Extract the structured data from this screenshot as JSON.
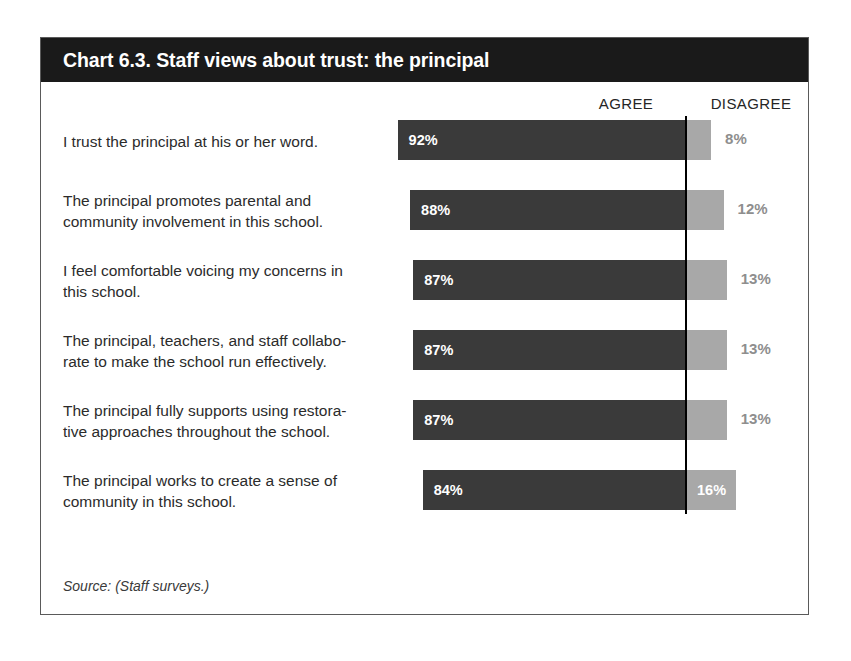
{
  "chart": {
    "title": "Chart 6.3. Staff views about trust: the principal",
    "source_note": "Source: (Staff surveys.)",
    "headers": {
      "agree": "AGREE",
      "disagree": "DISAGREE"
    }
  },
  "chart_data": {
    "type": "bar",
    "subtype": "stacked-horizontal-100",
    "title": "Chart 6.3. Staff views about trust: the principal",
    "xlabel": "",
    "ylabel": "",
    "xlim": [
      0,
      100
    ],
    "grid": false,
    "legend_position": "top-right",
    "categories": [
      "I trust the principal at his or her word.",
      "The principal promotes parental and community involvement in this school.",
      "I feel comfortable voicing my concerns in this school.",
      "The principal, teachers, and staff collaborate to make the school run effectively.",
      "The principal fully supports using restorative approaches throughout the school.",
      "The principal works to create a sense of community in this school."
    ],
    "series": [
      {
        "name": "AGREE",
        "color": "#3a3a3a",
        "values": [
          92,
          88,
          87,
          87,
          87,
          84
        ]
      },
      {
        "name": "DISAGREE",
        "color": "#a8a8a8",
        "values": [
          8,
          12,
          13,
          13,
          13,
          16
        ]
      }
    ],
    "value_labels": {
      "agree": [
        "92%",
        "88%",
        "87%",
        "87%",
        "87%",
        "84%"
      ],
      "disagree": [
        "8%",
        "12%",
        "13%",
        "13%",
        "13%",
        "16%"
      ]
    },
    "source": "Source: (Staff surveys.)"
  },
  "rows": [
    {
      "label_lines": [
        "I trust the principal at his or her word."
      ],
      "agree": 92,
      "disagree": 8,
      "agree_label": "92%",
      "disagree_label": "8%",
      "disagree_inside": false
    },
    {
      "label_lines": [
        "The principal promotes parental and",
        "community involvement in this school."
      ],
      "agree": 88,
      "disagree": 12,
      "agree_label": "88%",
      "disagree_label": "12%",
      "disagree_inside": false
    },
    {
      "label_lines": [
        "I feel comfortable voicing my concerns in",
        "this school."
      ],
      "agree": 87,
      "disagree": 13,
      "agree_label": "87%",
      "disagree_label": "13%",
      "disagree_inside": false
    },
    {
      "label_lines": [
        "The principal, teachers, and staff collabo-",
        "rate to make the school run effectively."
      ],
      "agree": 87,
      "disagree": 13,
      "agree_label": "87%",
      "disagree_label": "13%",
      "disagree_inside": false
    },
    {
      "label_lines": [
        "The principal fully supports using restora-",
        "tive approaches throughout the school."
      ],
      "agree": 87,
      "disagree": 13,
      "agree_label": "87%",
      "disagree_label": "13%",
      "disagree_inside": false
    },
    {
      "label_lines": [
        "The principal works to create a sense of",
        "community in this school."
      ],
      "agree": 84,
      "disagree": 16,
      "agree_label": "84%",
      "disagree_label": "16%",
      "disagree_inside": true
    }
  ],
  "geometry": {
    "axis_x": 645,
    "unit_px": 3.135,
    "bar_height": 40,
    "row_pitch": 70,
    "first_row_top": 0
  },
  "colors": {
    "agree_bar": "#3a3a3a",
    "disagree_bar": "#a8a8a8",
    "axis_line": "#000000",
    "title_bar": "#1a1a1a",
    "frame_border": "#5a5a5a",
    "outside_value": "#8e8e8e"
  }
}
